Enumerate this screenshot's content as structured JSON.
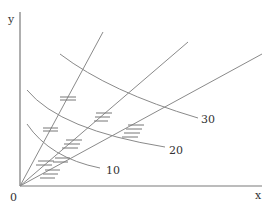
{
  "diagram": {
    "axes": {
      "x_label": "x",
      "y_label": "y",
      "origin_label": "0"
    },
    "curve_labels": [
      "10",
      "20",
      "30"
    ],
    "rays": 3
  }
}
